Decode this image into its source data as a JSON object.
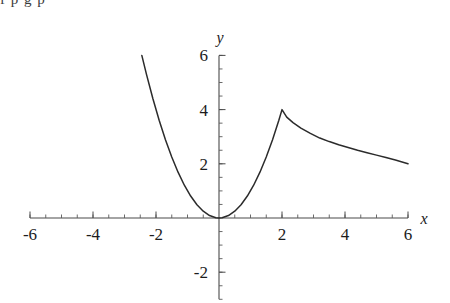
{
  "page": {
    "bleed_text": "f  p        g  p",
    "background": "#ffffff",
    "curve_color": "#2b2b2b",
    "axis_color": "#4a4a4a"
  },
  "chart_data": {
    "type": "line",
    "title": "",
    "subtitle": "",
    "xlabel": "x",
    "ylabel": "y",
    "grid": false,
    "legend": null,
    "xlim": [
      -6,
      6
    ],
    "ylim": [
      -3,
      6
    ],
    "x_ticks": [
      -6,
      -4,
      -2,
      2,
      4,
      6
    ],
    "x_tick_labels": [
      "-6",
      "-4",
      "-2",
      "2",
      "4",
      "6"
    ],
    "y_ticks": [
      -2,
      2,
      4,
      6
    ],
    "y_tick_labels": [
      "-2",
      "2",
      "4",
      "6"
    ],
    "x_minor_step": 0.5,
    "y_minor_step": 0.5,
    "annotations": [],
    "series": [
      {
        "name": "piecewise",
        "description": "parabola y = x^2 for x <= 2, decreasing branch from (2,4) to (6,2) for x > 2",
        "points": [
          [
            -2.45,
            6.0
          ],
          [
            -2.3,
            5.29
          ],
          [
            -2.1,
            4.41
          ],
          [
            -1.9,
            3.61
          ],
          [
            -1.7,
            2.89
          ],
          [
            -1.5,
            2.25
          ],
          [
            -1.3,
            1.69
          ],
          [
            -1.1,
            1.21
          ],
          [
            -0.9,
            0.81
          ],
          [
            -0.7,
            0.49
          ],
          [
            -0.5,
            0.25
          ],
          [
            -0.3,
            0.09
          ],
          [
            -0.1,
            0.01
          ],
          [
            0.0,
            0.0
          ],
          [
            0.1,
            0.01
          ],
          [
            0.3,
            0.09
          ],
          [
            0.5,
            0.25
          ],
          [
            0.7,
            0.49
          ],
          [
            0.9,
            0.81
          ],
          [
            1.1,
            1.21
          ],
          [
            1.3,
            1.69
          ],
          [
            1.5,
            2.25
          ],
          [
            1.7,
            2.89
          ],
          [
            1.9,
            3.61
          ],
          [
            2.0,
            4.0
          ],
          [
            2.15,
            3.72
          ],
          [
            2.35,
            3.52
          ],
          [
            2.6,
            3.32
          ],
          [
            2.9,
            3.12
          ],
          [
            3.2,
            2.95
          ],
          [
            3.5,
            2.82
          ],
          [
            3.8,
            2.7
          ],
          [
            4.1,
            2.6
          ],
          [
            4.4,
            2.5
          ],
          [
            4.7,
            2.41
          ],
          [
            5.0,
            2.32
          ],
          [
            5.3,
            2.23
          ],
          [
            5.6,
            2.14
          ],
          [
            6.0,
            2.0
          ]
        ]
      }
    ]
  }
}
